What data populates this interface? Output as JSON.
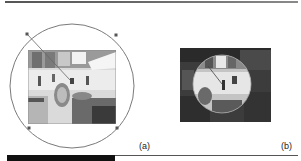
{
  "figure": {
    "panels": [
      {
        "id": "a",
        "label": "(a)",
        "description": "Circular selection with four handles over kitchen photo"
      },
      {
        "id": "b",
        "label": "(b)",
        "description": "Resulting image with spherized circular region"
      }
    ]
  },
  "colors": {
    "outline": "#777777",
    "handle": "#555555",
    "photo_a_bg": "#d8d8d8",
    "photo_b_bg": "#3a3a3a",
    "lens_bg": "#bdbdbd"
  }
}
